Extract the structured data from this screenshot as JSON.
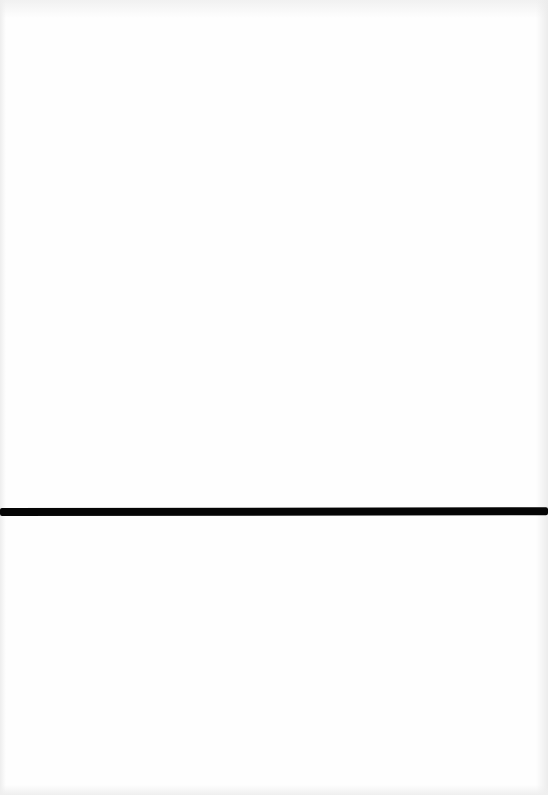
{
  "document": {
    "type": "scanned-page",
    "background_color": "#ffffff",
    "elements": [
      {
        "kind": "horizontal-rule",
        "color": "#050505",
        "y_position_px": 508,
        "thickness_px": 8,
        "span": "full-width"
      }
    ]
  }
}
